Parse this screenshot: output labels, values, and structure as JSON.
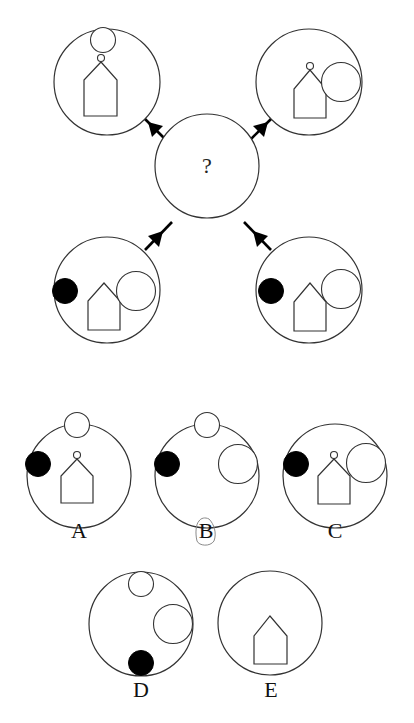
{
  "puzzle": {
    "center_mark": "?",
    "arrow_direction": "toward-center",
    "stimuli": [
      {
        "position": "top-left",
        "elements": [
          "small-circle-top",
          "house-with-small-circle-apex"
        ]
      },
      {
        "position": "top-right",
        "elements": [
          "house-with-small-circle-apex",
          "large-circle-right"
        ]
      },
      {
        "position": "bottom-left",
        "elements": [
          "black-dot-left",
          "house",
          "large-circle-right"
        ]
      },
      {
        "position": "bottom-right",
        "elements": [
          "black-dot-left",
          "house",
          "large-circle-right"
        ]
      }
    ]
  },
  "options": [
    {
      "label": "A",
      "elements": [
        "small-circle-top",
        "black-dot-left",
        "house-with-small-circle-apex"
      ],
      "marked": false
    },
    {
      "label": "B",
      "elements": [
        "small-circle-top",
        "black-dot-left",
        "large-circle-right"
      ],
      "marked": true
    },
    {
      "label": "C",
      "elements": [
        "black-dot-left",
        "house-with-small-circle-apex",
        "large-circle-right"
      ],
      "marked": false
    },
    {
      "label": "D",
      "elements": [
        "small-circle-top",
        "large-circle-right",
        "black-dot-bottom"
      ],
      "marked": false
    },
    {
      "label": "E",
      "elements": [
        "house"
      ],
      "marked": false
    }
  ],
  "colors": {
    "stroke": "#333333",
    "fill_dark": "#000000",
    "pencil": "#8a8a8a"
  }
}
